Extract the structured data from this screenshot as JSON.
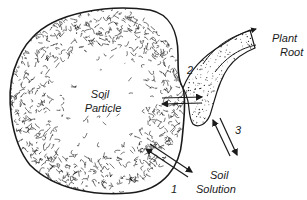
{
  "diagram": {
    "labels": {
      "particle_line1": "Soil",
      "particle_line2": "Particle",
      "root_line1": "Plant",
      "root_line2": "Root",
      "solution_line1": "Soil",
      "solution_line2": "Solution"
    },
    "pathways": [
      {
        "number": "1",
        "from": "Soil Particle",
        "to": "Soil Solution",
        "direction": "bidirectional"
      },
      {
        "number": "2",
        "from": "Soil Particle",
        "to": "Plant Root",
        "direction": "bidirectional"
      },
      {
        "number": "3",
        "from": "Plant Root",
        "to": "Soil Solution",
        "direction": "bidirectional"
      }
    ],
    "colors": {
      "ink": "#1a1a1a",
      "background": "#ffffff"
    }
  }
}
